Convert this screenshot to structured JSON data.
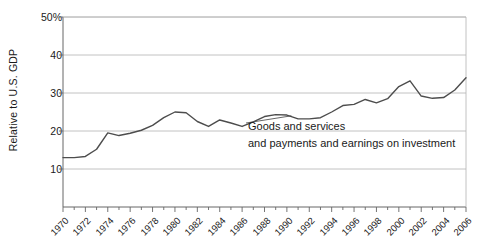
{
  "chart_data": {
    "type": "line",
    "title": "",
    "xlabel": "",
    "ylabel": "Relative to U.S. GDP",
    "xlim": [
      1970,
      2006
    ],
    "ylim": [
      0,
      50
    ],
    "grid": true,
    "legend_position": "none",
    "y_ticks": [
      {
        "value": 50,
        "label": "50%"
      },
      {
        "value": 40,
        "label": "40"
      },
      {
        "value": 30,
        "label": "30"
      },
      {
        "value": 20,
        "label": "20"
      },
      {
        "value": 10,
        "label": "10"
      }
    ],
    "x_ticks_labeled": [
      "1970",
      "1972",
      "1974",
      "1976",
      "1978",
      "1980",
      "1982",
      "1984",
      "1986",
      "1988",
      "1990",
      "1992",
      "1994",
      "1996",
      "1998",
      "2000",
      "2002",
      "2004",
      "2006"
    ],
    "x_minor_tick_interval": 1,
    "series": [
      {
        "name": "Goods and services and payments and earnings on investment",
        "color": "#4d4d4d",
        "x": [
          1970,
          1971,
          1972,
          1973,
          1974,
          1975,
          1976,
          1977,
          1978,
          1979,
          1980,
          1981,
          1982,
          1983,
          1984,
          1985,
          1986,
          1987,
          1988,
          1989,
          1990,
          1991,
          1992,
          1993,
          1994,
          1995,
          1996,
          1997,
          1998,
          1999,
          2000,
          2001,
          2002,
          2003,
          2004,
          2005,
          2006
        ],
        "values": [
          13.0,
          13.0,
          13.3,
          15.2,
          19.5,
          18.8,
          19.4,
          20.2,
          21.5,
          23.5,
          25.0,
          24.8,
          22.5,
          21.2,
          22.9,
          22.1,
          21.2,
          22.4,
          23.8,
          24.3,
          24.2,
          23.2,
          23.2,
          23.5,
          25.0,
          26.7,
          27.0,
          28.3,
          27.4,
          28.5,
          31.7,
          33.2,
          29.2,
          28.6,
          28.8,
          30.8,
          34.0
        ]
      }
    ],
    "annotations": [
      {
        "name": "series-callout",
        "line1": "Goods and services",
        "line2": "and payments and earnings on investment",
        "has_leader_line": true
      }
    ]
  }
}
